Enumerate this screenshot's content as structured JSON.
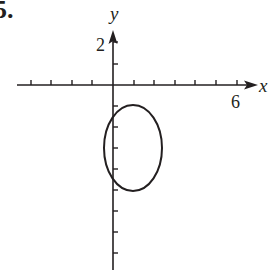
{
  "problem_number": "5.",
  "axes": {
    "x_label": "x",
    "y_label": "y",
    "x_tick_label": "6",
    "y_tick_label": "2",
    "x_range": [
      -4,
      6
    ],
    "y_range": [
      -8,
      2
    ],
    "tick_spacing": 1
  },
  "curve": {
    "type": "ellipse",
    "center": [
      1,
      -3
    ],
    "semi_axis_x": 1.333,
    "semi_axis_y": 2,
    "description": "vertical ellipse centered near (1, -3)"
  },
  "colors": {
    "ink": "#231f20",
    "background": "#ffffff"
  }
}
